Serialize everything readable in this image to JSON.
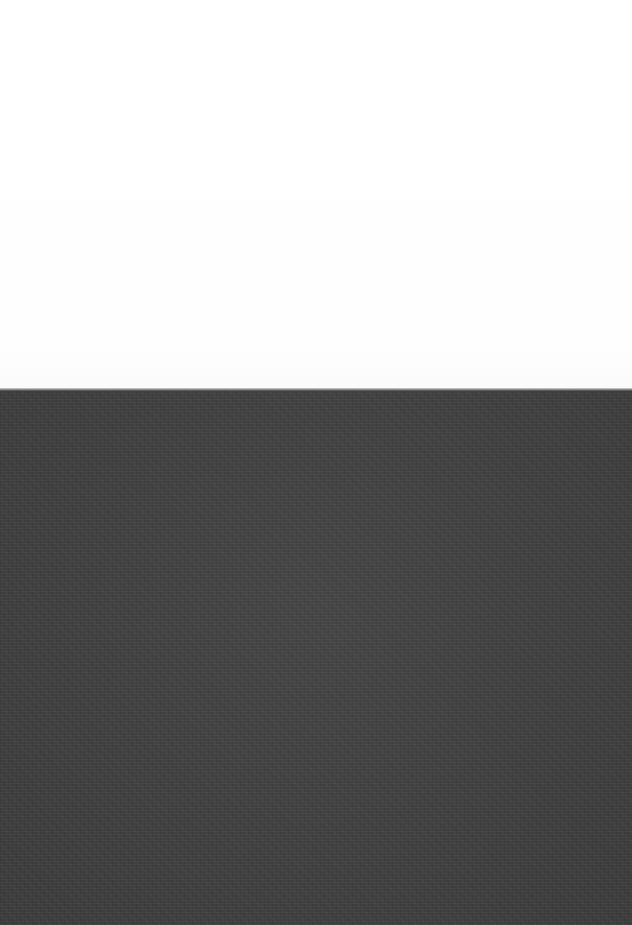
{
  "scene": {
    "description": "White paper sheet above a dark gray textured fabric surface",
    "regions": [
      {
        "name": "white-paper",
        "color": "#ffffff"
      },
      {
        "name": "dark-fabric",
        "color": "#3f3f3f"
      }
    ]
  }
}
